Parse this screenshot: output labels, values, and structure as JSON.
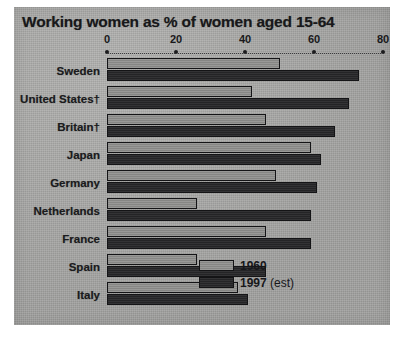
{
  "chart_data": {
    "type": "bar",
    "orientation": "horizontal",
    "title": "Working women as % of women aged 15-64",
    "xlabel": "",
    "ylabel": "",
    "xlim": [
      0,
      80
    ],
    "xticks": [
      0,
      20,
      40,
      60,
      80
    ],
    "xtick_labels": [
      "0",
      "20",
      "40",
      "60",
      "80"
    ],
    "grid": false,
    "axis_style": "dotted",
    "legend_position": "bottom-right",
    "categories": [
      "Sweden",
      "United States†",
      "Britain†",
      "Japan",
      "Germany",
      "Netherlands",
      "France",
      "Spain",
      "Italy"
    ],
    "series": [
      {
        "name": "1960",
        "color": "#8d8d8b",
        "values": [
          50,
          42,
          46,
          59,
          49,
          26,
          46,
          26,
          38
        ]
      },
      {
        "name": "1997 (est)",
        "color": "#28282a",
        "values": [
          73,
          70,
          66,
          62,
          61,
          59,
          59,
          46,
          41
        ]
      }
    ]
  },
  "legend": {
    "items": [
      {
        "label": "1960",
        "note": ""
      },
      {
        "label": "1997",
        "note": " (est)"
      }
    ]
  },
  "colors": {
    "panel_background": "#a9a9a7",
    "page_background": "#ffffff",
    "text": "#18181a",
    "series_1960": "#8d8d8b",
    "series_1997": "#28282a"
  }
}
